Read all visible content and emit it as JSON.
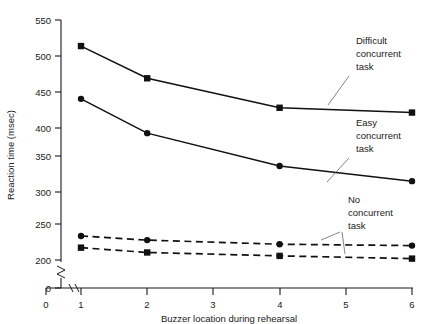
{
  "chart_data": {
    "type": "line",
    "title": "",
    "xlabel": "Buzzer location during rehearsal",
    "ylabel": "Reaction time (msec)",
    "x": [
      1,
      2,
      4,
      6
    ],
    "xlim": [
      0,
      6
    ],
    "ylim": [
      200,
      550
    ],
    "xticks": [
      "0",
      "1",
      "2",
      "3",
      "4",
      "5",
      "6"
    ],
    "yticks": [
      "0",
      "200",
      "250",
      "300",
      "350",
      "400",
      "450",
      "500",
      "550"
    ],
    "grid": false,
    "legend_position": "inline-annotations",
    "axis_break_y": true,
    "axis_break_x": true,
    "series": [
      {
        "name": "Difficult concurrent task",
        "marker": "square",
        "linestyle": "solid",
        "values": [
          512,
          465,
          422,
          415
        ]
      },
      {
        "name": "Easy concurrent task",
        "marker": "circle",
        "linestyle": "solid",
        "values": [
          435,
          385,
          337,
          315
        ]
      },
      {
        "name": "No concurrent task (circle)",
        "marker": "circle",
        "linestyle": "dashed",
        "values": [
          235,
          229,
          223,
          221
        ]
      },
      {
        "name": "No concurrent task (square)",
        "marker": "square",
        "linestyle": "dashed",
        "values": [
          218,
          211,
          206,
          202
        ]
      }
    ],
    "annotations": [
      {
        "id": "difficult",
        "lines": [
          "Difficult",
          "concurrent",
          "task"
        ]
      },
      {
        "id": "easy",
        "lines": [
          "Easy",
          "concurrent",
          "task"
        ]
      },
      {
        "id": "none",
        "lines": [
          "No",
          "concurrent",
          "task"
        ]
      }
    ],
    "colors": {
      "line": "#111111",
      "axis": "#1a1a1a",
      "text": "#1a1a1a",
      "leader": "#666666",
      "background": "#ffffff"
    }
  }
}
